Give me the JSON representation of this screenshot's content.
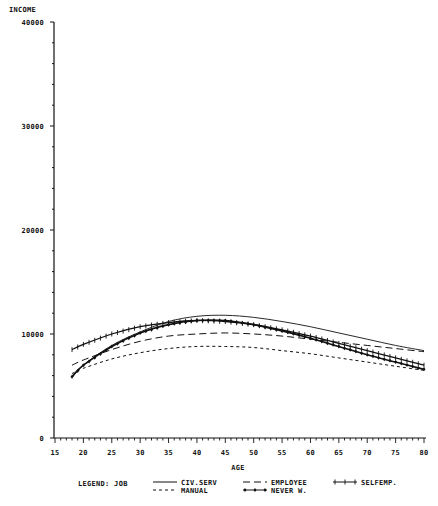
{
  "chart_data": {
    "type": "line",
    "title": "",
    "ylabel": "INCOME",
    "xlabel": "AGE",
    "xlim": [
      15,
      80
    ],
    "ylim": [
      0,
      40000
    ],
    "x_ticks": [
      15,
      20,
      25,
      30,
      35,
      40,
      45,
      50,
      55,
      60,
      65,
      70,
      75,
      80
    ],
    "y_ticks": [
      0,
      10000,
      20000,
      30000,
      40000
    ],
    "y_tick_labels": [
      "0",
      "10000",
      "20000",
      "30000",
      "40000"
    ],
    "grid": false,
    "legend_title": "LEGEND: JOB",
    "legend_position": "bottom",
    "x": [
      18,
      20,
      25,
      30,
      35,
      40,
      45,
      50,
      55,
      60,
      65,
      70,
      75,
      80
    ],
    "series": [
      {
        "name": "CIV.SERV",
        "style": "solid",
        "values": [
          5800,
          7000,
          8900,
          10200,
          11200,
          11700,
          11800,
          11600,
          11200,
          10700,
          10100,
          9500,
          8900,
          8400
        ]
      },
      {
        "name": "EMPLOYEE",
        "style": "long-dash",
        "values": [
          7000,
          7500,
          8500,
          9300,
          9800,
          10000,
          10100,
          10000,
          9800,
          9500,
          9200,
          8900,
          8600,
          8300
        ]
      },
      {
        "name": "SELFEMP.",
        "style": "plus-markers",
        "values": [
          8500,
          9000,
          10000,
          10700,
          11100,
          11300,
          11200,
          10900,
          10400,
          9800,
          9100,
          8400,
          7700,
          7000
        ]
      },
      {
        "name": "MANUAL",
        "style": "short-dash",
        "values": [
          6200,
          6700,
          7600,
          8200,
          8600,
          8800,
          8800,
          8700,
          8400,
          8100,
          7700,
          7300,
          6900,
          6500
        ]
      },
      {
        "name": "NEVER W.",
        "style": "diamond-markers",
        "values": [
          5900,
          7000,
          8800,
          10100,
          10900,
          11300,
          11300,
          10900,
          10300,
          9600,
          8800,
          8000,
          7300,
          6600
        ]
      }
    ]
  },
  "legend": {
    "title": "LEGEND: JOB",
    "items": [
      "CIV.SERV",
      "EMPLOYEE",
      "SELFEMP.",
      "MANUAL",
      "NEVER W."
    ]
  }
}
